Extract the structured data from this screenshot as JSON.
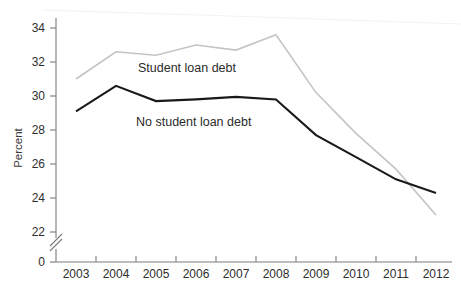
{
  "chart_data": {
    "type": "line",
    "title": "",
    "xlabel": "",
    "ylabel": "Percent",
    "categories": [
      "2003",
      "2004",
      "2005",
      "2006",
      "2007",
      "2008",
      "2009",
      "2010",
      "2011",
      "2012"
    ],
    "x": [
      2003,
      2004,
      2005,
      2006,
      2007,
      2008,
      2009,
      2010,
      2011,
      2012
    ],
    "ylim": [
      22,
      34
    ],
    "yticks": [
      22,
      24,
      26,
      28,
      30,
      32,
      34
    ],
    "ytick_labels": [
      "22",
      "24",
      "26",
      "28",
      "30",
      "32",
      "34"
    ],
    "y_axis_break": true,
    "y_axis_zero_label": "0",
    "grid": false,
    "legend_position": "inline-annotation",
    "series": [
      {
        "name": "Student loan debt",
        "color": "#c4c4c4",
        "values": [
          31.0,
          32.6,
          32.4,
          33.0,
          32.7,
          33.6,
          30.2,
          27.8,
          25.7,
          23.0
        ]
      },
      {
        "name": "No student loan debt",
        "color": "#1a1a1a",
        "values": [
          29.1,
          30.6,
          29.7,
          29.8,
          29.95,
          29.8,
          27.7,
          26.4,
          25.1,
          24.3
        ]
      }
    ],
    "annotations": [
      {
        "text": "Student loan debt",
        "x": 2004.55,
        "y": 31.65
      },
      {
        "text": "No student loan debt",
        "x": 2004.5,
        "y": 28.45
      }
    ]
  },
  "axes": {
    "y_title": "Percent",
    "y_tick_labels": [
      "34",
      "32",
      "30",
      "28",
      "26",
      "24",
      "22"
    ],
    "y_zero_label": "0",
    "x_tick_labels": [
      "2003",
      "2004",
      "2005",
      "2006",
      "2007",
      "2008",
      "2009",
      "2010",
      "2011",
      "2012"
    ]
  },
  "colors": {
    "student_loan_debt_line": "#c4c4c4",
    "no_student_loan_debt_line": "#1a1a1a",
    "axis": "#7a7a7a",
    "text": "#2e2e2e",
    "background": "#ffffff"
  }
}
